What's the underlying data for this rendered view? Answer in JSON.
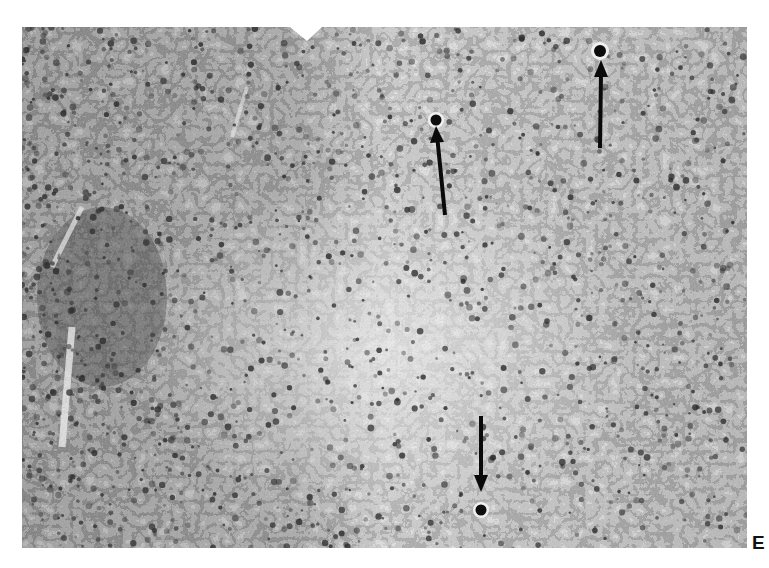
{
  "figure": {
    "panel_label": "E",
    "image_type": "grayscale histology micrograph",
    "colors": {
      "background": "#ffffff",
      "tissue_dark": "#3a3a3a",
      "tissue_mid": "#8a8a8a",
      "tissue_light": "#e8e8e8",
      "arrow": "#0a0a0a"
    },
    "arrows": [
      {
        "id": "arrow-1",
        "direction": "up",
        "tail": [
          445,
          215
        ],
        "head": [
          436,
          128
        ]
      },
      {
        "id": "arrow-2",
        "direction": "up",
        "tail": [
          600,
          148
        ],
        "head": [
          601,
          62
        ]
      },
      {
        "id": "arrow-3",
        "direction": "down",
        "tail": [
          481,
          416
        ],
        "head": [
          481,
          490
        ]
      }
    ]
  }
}
